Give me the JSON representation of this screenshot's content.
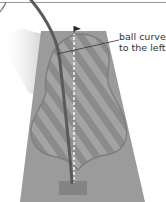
{
  "diagram": {
    "annotation": {
      "line1": "ball curves",
      "line2": "to the left"
    },
    "colors": {
      "background": "#ffffff",
      "fairway": "#9a9a9a",
      "stripes": "#8a8a8a",
      "outline": "#7d7d7d",
      "trajectory": "#555555",
      "target_line": "#f2f2f2",
      "tee_box": "#858585",
      "shadow": "#d9d9d9",
      "label": "#333333"
    },
    "elements": [
      "fairway",
      "striped-landing-area",
      "curved-ball-trajectory",
      "dashed-target-line",
      "flag",
      "tee-box",
      "leader-line"
    ]
  }
}
